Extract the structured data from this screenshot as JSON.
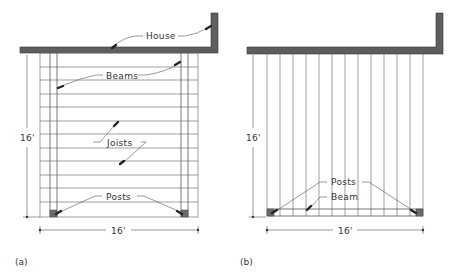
{
  "figure": {
    "panels": [
      {
        "id": "a",
        "caption": "(a)",
        "description": "Deck with joists running parallel to house, supported by two beams",
        "labels": {
          "house": "House",
          "beams": "Beams",
          "joists": "Joists",
          "posts": "Posts"
        },
        "dimensions": {
          "depth": "16'",
          "width": "16'"
        }
      },
      {
        "id": "b",
        "caption": "(b)",
        "description": "Deck with joists running perpendicular to house, supported by a single beam",
        "labels": {
          "posts": "Posts",
          "beam": "Beam"
        },
        "dimensions": {
          "depth": "16'",
          "width": "16'"
        }
      }
    ],
    "colors": {
      "wall": "#5e5e5e",
      "lines": "#777777",
      "post": "#6b6b6b",
      "text": "#333333"
    }
  }
}
